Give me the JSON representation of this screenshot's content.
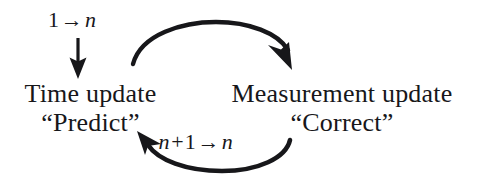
{
  "diagram": {
    "background_color": "#ffffff",
    "ink_color": "#17171a",
    "top_label": {
      "start_value": "1",
      "arrow": "→",
      "end_variable": "n",
      "full_text": "1 → n"
    },
    "bottom_label": {
      "left_variable": "n",
      "plus": "+",
      "increment": "1",
      "arrow": "→",
      "right_variable": "n",
      "full_text": "n+1 → n"
    },
    "left_block": {
      "line1": "Time update",
      "line2": "“Predict”"
    },
    "right_block": {
      "line1": "Measurement update",
      "line2": "“Correct”"
    },
    "arrows": {
      "entry_arrow": "downward-arrow-into-time-update",
      "top_arrow": "curved-arrow-predict-to-correct",
      "bottom_arrow": "curved-arrow-correct-to-predict"
    }
  }
}
